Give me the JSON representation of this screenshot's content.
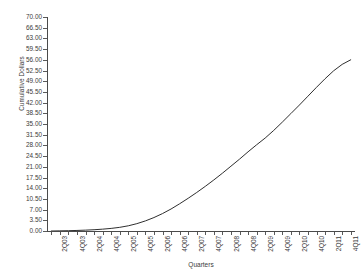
{
  "chart_data": {
    "type": "line",
    "title": "",
    "xlabel": "Quarters",
    "ylabel": "Cumulative Dollars",
    "ylim": [
      0,
      70
    ],
    "ytick_step": 3.5,
    "grid": false,
    "legend": false,
    "line_color": "#2f2f2f",
    "ytick_labels": [
      "70.00",
      "66.50",
      "63.00",
      "59.50",
      "56.00",
      "52.50",
      "49.00",
      "45.50",
      "42.00",
      "38.50",
      "35.00",
      "31.50",
      "28.00",
      "24.50",
      "21.00",
      "17.50",
      "14.00",
      "10.50",
      "7.00",
      "3.50",
      "0.00"
    ],
    "ytick_values": [
      70.0,
      66.5,
      63.0,
      59.5,
      56.0,
      52.5,
      49.0,
      45.5,
      42.0,
      38.5,
      35.0,
      31.5,
      28.0,
      24.5,
      21.0,
      17.5,
      14.0,
      10.5,
      7.0,
      3.5,
      0.0
    ],
    "categories": [
      "1Q03",
      "2Q03",
      "3Q03",
      "4Q03",
      "1Q04",
      "2Q04",
      "3Q04",
      "4Q04",
      "1Q05",
      "2Q05",
      "3Q05",
      "4Q05",
      "1Q06",
      "2Q06",
      "3Q06",
      "4Q06",
      "1Q07",
      "2Q07",
      "3Q07",
      "4Q07",
      "1Q08",
      "2Q08",
      "3Q08",
      "4Q08",
      "1Q09",
      "2Q09",
      "3Q09",
      "4Q09",
      "1Q10",
      "2Q10",
      "3Q10",
      "4Q10",
      "1Q11",
      "2Q11",
      "3Q11",
      "4Q11"
    ],
    "xtick_labels_shown": [
      "2Q03",
      "4Q03",
      "2Q04",
      "4Q04",
      "2Q05",
      "4Q05",
      "2Q06",
      "4Q06",
      "2Q07",
      "4Q07",
      "2Q08",
      "4Q08",
      "2Q09",
      "4Q09",
      "2Q10",
      "4Q10",
      "2Q11",
      "4Q11"
    ],
    "values": [
      0.0,
      0.05,
      0.1,
      0.18,
      0.28,
      0.42,
      0.6,
      0.85,
      1.2,
      1.7,
      2.4,
      3.3,
      4.4,
      5.7,
      7.2,
      8.9,
      10.7,
      12.6,
      14.6,
      16.7,
      18.9,
      21.2,
      23.5,
      25.9,
      28.2,
      30.4,
      32.9,
      35.6,
      38.4,
      41.2,
      44.1,
      47.0,
      49.8,
      52.4,
      54.5,
      56.0
    ]
  }
}
